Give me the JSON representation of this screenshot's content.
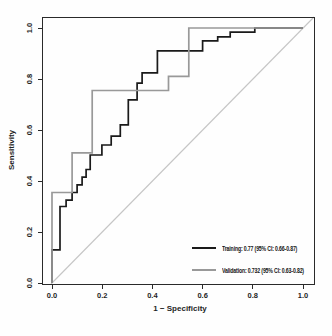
{
  "chart_data": {
    "type": "line",
    "subtype": "roc-step-curves",
    "title": "",
    "xlabel": "1 − Specificity",
    "ylabel": "Sensitivity",
    "xlim": [
      0,
      1
    ],
    "ylim": [
      0,
      1
    ],
    "grid": false,
    "frame": true,
    "xticks": [
      0.0,
      0.2,
      0.4,
      0.6,
      0.8,
      1.0
    ],
    "yticks": [
      0.0,
      0.2,
      0.4,
      0.6,
      0.8,
      1.0
    ],
    "xtick_labels": [
      "0.0",
      "0.2",
      "0.4",
      "0.6",
      "0.8",
      "1.0"
    ],
    "ytick_labels": [
      "0.0",
      "0.2",
      "0.4",
      "0.6",
      "0.8",
      "1.0"
    ],
    "axis_color": "#2a2a2a",
    "reference_line": {
      "name": "chance-diagonal",
      "from": [
        0,
        0
      ],
      "to": [
        1,
        1
      ],
      "color": "#c6c6c6",
      "width": 1.1
    },
    "legend_position": "bottom-right",
    "series": [
      {
        "name": "Training",
        "auc": "0.77",
        "ci_95": "0.66-0.87",
        "label": "Training: 0.77 (95% CI: 0.66-0.87)",
        "color": "#1a1a1a",
        "width": 1.7,
        "points": [
          [
            0,
            0
          ],
          [
            0,
            0.13
          ],
          [
            0.032,
            0.13
          ],
          [
            0.032,
            0.3
          ],
          [
            0.056,
            0.3
          ],
          [
            0.056,
            0.325
          ],
          [
            0.08,
            0.325
          ],
          [
            0.08,
            0.355
          ],
          [
            0.1,
            0.355
          ],
          [
            0.1,
            0.385
          ],
          [
            0.12,
            0.385
          ],
          [
            0.12,
            0.415
          ],
          [
            0.136,
            0.415
          ],
          [
            0.136,
            0.445
          ],
          [
            0.152,
            0.445
          ],
          [
            0.152,
            0.502
          ],
          [
            0.199,
            0.502
          ],
          [
            0.199,
            0.541
          ],
          [
            0.236,
            0.541
          ],
          [
            0.236,
            0.576
          ],
          [
            0.272,
            0.576
          ],
          [
            0.272,
            0.62
          ],
          [
            0.304,
            0.62
          ],
          [
            0.304,
            0.718
          ],
          [
            0.339,
            0.718
          ],
          [
            0.339,
            0.784
          ],
          [
            0.359,
            0.784
          ],
          [
            0.359,
            0.824
          ],
          [
            0.42,
            0.824
          ],
          [
            0.42,
            0.91
          ],
          [
            0.6,
            0.91
          ],
          [
            0.6,
            0.95
          ],
          [
            0.66,
            0.95
          ],
          [
            0.66,
            0.965
          ],
          [
            0.71,
            0.965
          ],
          [
            0.71,
            0.984
          ],
          [
            0.808,
            0.984
          ],
          [
            0.808,
            1.0
          ],
          [
            1.0,
            1.0
          ]
        ]
      },
      {
        "name": "Validation",
        "auc": "0.732",
        "ci_95": "0.63-0.82",
        "label": "Validation: 0.732 (95% CI: 0.63-0.82)",
        "color": "#999999",
        "width": 1.7,
        "points": [
          [
            0,
            0
          ],
          [
            0,
            0.355
          ],
          [
            0.08,
            0.355
          ],
          [
            0.08,
            0.51
          ],
          [
            0.16,
            0.51
          ],
          [
            0.16,
            0.755
          ],
          [
            0.464,
            0.755
          ],
          [
            0.464,
            0.81
          ],
          [
            0.545,
            0.81
          ],
          [
            0.545,
            1.0
          ],
          [
            1.0,
            1.0
          ]
        ]
      }
    ]
  }
}
